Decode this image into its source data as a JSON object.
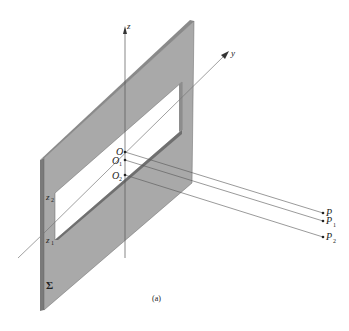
{
  "figure": {
    "caption": "(a)",
    "screen_label": "Σ",
    "axes": {
      "z_label": "z",
      "y_label": "y"
    },
    "slit_edges": {
      "upper": "z",
      "upper_sub": "2",
      "lower": "z",
      "lower_sub": "1"
    },
    "origins": [
      {
        "label": "O",
        "sub": ""
      },
      {
        "label": "O",
        "sub": "1"
      },
      {
        "label": "O",
        "sub": "2"
      }
    ],
    "points": [
      {
        "label": "P",
        "sub": ""
      },
      {
        "label": "P",
        "sub": "1"
      },
      {
        "label": "P",
        "sub": "2"
      }
    ],
    "colors": {
      "screen_face": "#a9a9a9",
      "screen_edge": "#7a7a7a",
      "line": "#444444",
      "slit": "#ffffff"
    }
  }
}
